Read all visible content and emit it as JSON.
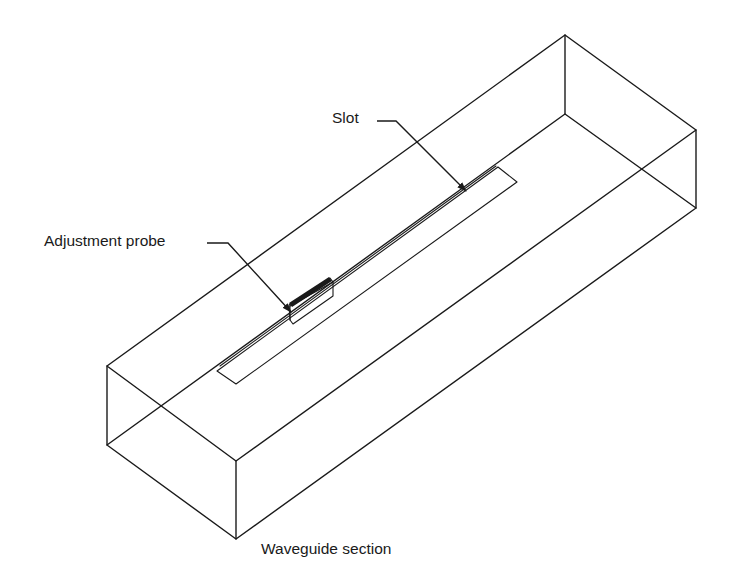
{
  "figure": {
    "type": "isometric wireframe drawing",
    "line_color": "#1a1a1a",
    "background": "#ffffff"
  },
  "labels": {
    "slot": "Slot",
    "probe": "Adjustment probe",
    "section": "Waveguide section"
  },
  "components": [
    {
      "id": "waveguide",
      "name": "Waveguide section",
      "shape": "rectangular box (wireframe)"
    },
    {
      "id": "slot",
      "name": "Slot",
      "shape": "long thin rectangle on top face"
    },
    {
      "id": "probe",
      "name": "Adjustment probe",
      "shape": "small block inserted in slot"
    }
  ]
}
